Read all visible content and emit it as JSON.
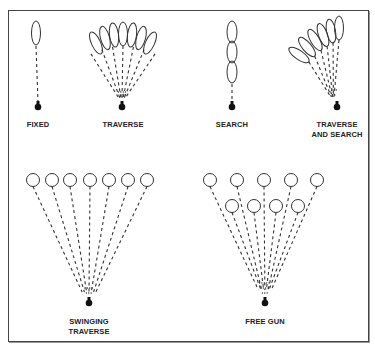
{
  "colors": {
    "stroke": "#333333",
    "gun": "#111111",
    "border": "#444444"
  },
  "panels": [
    {
      "id": "fixed",
      "label_lines": [
        "FIXED"
      ],
      "gun": [
        38,
        107
      ],
      "label_pos": [
        38,
        121
      ]
    },
    {
      "id": "traverse",
      "label_lines": [
        "TRAVERSE"
      ],
      "gun": [
        122,
        107
      ],
      "label_pos": [
        122,
        121
      ]
    },
    {
      "id": "search",
      "label_lines": [
        "SEARCH"
      ],
      "gun": [
        232,
        107
      ],
      "label_pos": [
        232,
        121
      ]
    },
    {
      "id": "traverse-and-search",
      "label_lines": [
        "TRAVERSE",
        "AND SEARCH"
      ],
      "gun": [
        337,
        107
      ],
      "label_pos": [
        337,
        121
      ]
    },
    {
      "id": "swinging-traverse",
      "label_lines": [
        "SWINGING",
        "TRAVERSE"
      ],
      "gun": [
        89,
        303
      ],
      "label_pos": [
        89,
        318
      ]
    },
    {
      "id": "free-gun",
      "label_lines": [
        "FREE GUN"
      ],
      "gun": [
        265,
        303
      ],
      "label_pos": [
        265,
        318
      ]
    }
  ],
  "labels": {
    "fixed": "FIXED",
    "traverse": "TRAVERSE",
    "search": "SEARCH",
    "traverse_and_search_1": "TRAVERSE",
    "traverse_and_search_2": "AND SEARCH",
    "swinging_traverse_1": "SWINGING",
    "swinging_traverse_2": "TRAVERSE",
    "free_gun": "FREE GUN"
  },
  "targets": {
    "fixed": [
      {
        "cx": 36,
        "cy": 33,
        "rx": 4.5,
        "ry": 12,
        "rot": 0
      }
    ],
    "traverse": [
      {
        "cx": 96,
        "cy": 43,
        "rx": 4.5,
        "ry": 12,
        "rot": -25
      },
      {
        "cx": 105,
        "cy": 38,
        "rx": 4.5,
        "ry": 12,
        "rot": -15
      },
      {
        "cx": 114,
        "cy": 35,
        "rx": 4.5,
        "ry": 12,
        "rot": -7
      },
      {
        "cx": 123,
        "cy": 34,
        "rx": 4.5,
        "ry": 12,
        "rot": 0
      },
      {
        "cx": 132,
        "cy": 35,
        "rx": 4.5,
        "ry": 12,
        "rot": 7
      },
      {
        "cx": 141,
        "cy": 38,
        "rx": 4.5,
        "ry": 12,
        "rot": 15
      },
      {
        "cx": 150,
        "cy": 43,
        "rx": 4.5,
        "ry": 12,
        "rot": 25
      }
    ],
    "search": [
      {
        "cx": 232,
        "cy": 32,
        "rx": 5,
        "ry": 11,
        "rot": 0
      },
      {
        "cx": 232,
        "cy": 52,
        "rx": 5,
        "ry": 11,
        "rot": 0
      },
      {
        "cx": 232,
        "cy": 72,
        "rx": 5,
        "ry": 11,
        "rot": 0
      }
    ],
    "traverse_and_search": [
      {
        "cx": 299,
        "cy": 55,
        "rx": 4.5,
        "ry": 12,
        "rot": -55
      },
      {
        "cx": 307,
        "cy": 47,
        "rx": 4.5,
        "ry": 12,
        "rot": -40
      },
      {
        "cx": 315,
        "cy": 40,
        "rx": 4.5,
        "ry": 12,
        "rot": -30
      },
      {
        "cx": 323,
        "cy": 35,
        "rx": 4.5,
        "ry": 12,
        "rot": -20
      },
      {
        "cx": 331,
        "cy": 31,
        "rx": 4.5,
        "ry": 12,
        "rot": -10
      },
      {
        "cx": 339,
        "cy": 28,
        "rx": 4.5,
        "ry": 12,
        "rot": 0
      }
    ],
    "swinging_traverse": [
      {
        "cx": 33,
        "cy": 180,
        "r": 6.5
      },
      {
        "cx": 52,
        "cy": 180,
        "r": 6.5
      },
      {
        "cx": 70,
        "cy": 180,
        "r": 6.5
      },
      {
        "cx": 90,
        "cy": 180,
        "r": 6.5
      },
      {
        "cx": 109,
        "cy": 180,
        "r": 6.5
      },
      {
        "cx": 128,
        "cy": 180,
        "r": 6.5
      },
      {
        "cx": 147,
        "cy": 180,
        "r": 6.5
      }
    ],
    "free_gun": [
      {
        "cx": 210,
        "cy": 180,
        "r": 6.5
      },
      {
        "cx": 237,
        "cy": 180,
        "r": 6.5
      },
      {
        "cx": 264,
        "cy": 180,
        "r": 6.5
      },
      {
        "cx": 291,
        "cy": 180,
        "r": 6.5
      },
      {
        "cx": 317,
        "cy": 180,
        "r": 6.5
      },
      {
        "cx": 232,
        "cy": 206,
        "r": 6.5
      },
      {
        "cx": 254,
        "cy": 206,
        "r": 6.5
      },
      {
        "cx": 276,
        "cy": 206,
        "r": 6.5
      },
      {
        "cx": 298,
        "cy": 206,
        "r": 6.5
      }
    ]
  }
}
